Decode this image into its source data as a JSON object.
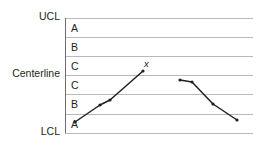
{
  "chart_data": {
    "type": "line",
    "title": "",
    "xlabel": "",
    "ylabel": "",
    "grid": true,
    "legend_position": "none",
    "axis_labels": {
      "upper_control_limit": "UCL",
      "centerline": "Centerline",
      "lower_control_limit": "LCL"
    },
    "zones": [
      {
        "label": "A",
        "position": "upper-outer"
      },
      {
        "label": "B",
        "position": "upper-middle"
      },
      {
        "label": "C",
        "position": "upper-inner"
      },
      {
        "label": "C",
        "position": "lower-inner"
      },
      {
        "label": "B",
        "position": "lower-middle"
      },
      {
        "label": "A",
        "position": "lower-outer"
      }
    ],
    "gridlines": [
      {
        "name": "UCL",
        "y": 18
      },
      {
        "name": "upper-A-B",
        "y": 37
      },
      {
        "name": "upper-B-C",
        "y": 56
      },
      {
        "name": "Centerline",
        "y": 75
      },
      {
        "name": "lower-C-B",
        "y": 94
      },
      {
        "name": "lower-B-A",
        "y": 114
      },
      {
        "name": "LCL",
        "y": 133
      }
    ],
    "plot_area": {
      "left": 65,
      "right": 253,
      "top": 18,
      "bottom": 133
    },
    "annotations": [
      {
        "text": "x",
        "x": 144,
        "y": 59,
        "style": "italic"
      }
    ],
    "series": [
      {
        "name": "segment-1",
        "points": [
          {
            "x": 75,
            "y": 122
          },
          {
            "x": 100,
            "y": 105
          },
          {
            "x": 110,
            "y": 100
          },
          {
            "x": 143,
            "y": 71
          }
        ]
      },
      {
        "name": "segment-2",
        "points": [
          {
            "x": 180,
            "y": 80
          },
          {
            "x": 192,
            "y": 82
          },
          {
            "x": 213,
            "y": 104
          },
          {
            "x": 237,
            "y": 120
          }
        ]
      }
    ],
    "colors": {
      "gridline": "#b9b9b9",
      "axis": "#6e6e6e",
      "data_line": "#231f20",
      "text": "#231f20",
      "background": "#ffffff"
    }
  }
}
